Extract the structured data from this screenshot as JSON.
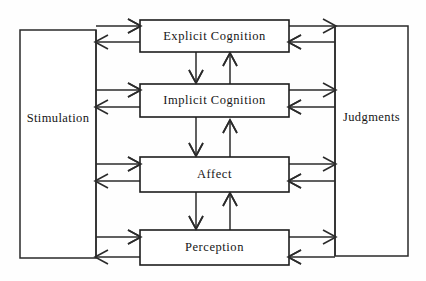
{
  "diagram": {
    "canvas": {
      "width": 426,
      "height": 281,
      "background": "#fefefe"
    },
    "colors": {
      "stroke": "#2b2b2b",
      "box_stroke": "#1d1d1d",
      "box_fill": "#ffffff",
      "text": "#161616"
    },
    "input_node": {
      "label": "Stimulation",
      "x": 20,
      "y": 30,
      "width": 76,
      "height": 228
    },
    "output_node": {
      "label": "Judgments",
      "x": 335,
      "y": 26,
      "width": 73,
      "height": 230
    },
    "process_nodes": [
      {
        "label": "Explicit Cognition",
        "x": 140,
        "y": 20,
        "width": 149,
        "height": 32
      },
      {
        "label": "Implicit Cognition",
        "x": 140,
        "y": 84,
        "width": 149,
        "height": 33
      },
      {
        "label": "Affect",
        "x": 140,
        "y": 157,
        "width": 149,
        "height": 35
      },
      {
        "label": "Perception",
        "x": 140,
        "y": 230,
        "width": 149,
        "height": 35
      }
    ],
    "connections": {
      "left_inbound": [
        {
          "from": "Stimulation",
          "to": "Explicit Cognition",
          "direction": "right"
        },
        {
          "from": "Stimulation",
          "to": "Implicit Cognition",
          "direction": "right"
        },
        {
          "from": "Stimulation",
          "to": "Affect",
          "direction": "right"
        },
        {
          "from": "Stimulation",
          "to": "Perception",
          "direction": "right"
        }
      ],
      "left_outbound": [
        {
          "from": "Explicit Cognition",
          "to": "Stimulation",
          "direction": "left"
        },
        {
          "from": "Implicit Cognition",
          "to": "Stimulation",
          "direction": "left"
        },
        {
          "from": "Affect",
          "to": "Stimulation",
          "direction": "left"
        },
        {
          "from": "Perception",
          "to": "Stimulation",
          "direction": "left"
        }
      ],
      "right_outbound": [
        {
          "from": "Explicit Cognition",
          "to": "Judgments",
          "direction": "right"
        },
        {
          "from": "Implicit Cognition",
          "to": "Judgments",
          "direction": "right"
        },
        {
          "from": "Affect",
          "to": "Judgments",
          "direction": "right"
        },
        {
          "from": "Perception",
          "to": "Judgments",
          "direction": "right"
        }
      ],
      "right_inbound": [
        {
          "from": "Judgments",
          "to": "Explicit Cognition",
          "direction": "left"
        },
        {
          "from": "Judgments",
          "to": "Implicit Cognition",
          "direction": "left"
        },
        {
          "from": "Judgments",
          "to": "Affect",
          "direction": "left"
        },
        {
          "from": "Judgments",
          "to": "Perception",
          "direction": "left"
        }
      ],
      "vertical_down": [
        {
          "from": "Explicit Cognition",
          "to": "Implicit Cognition"
        },
        {
          "from": "Implicit Cognition",
          "to": "Affect"
        },
        {
          "from": "Affect",
          "to": "Perception"
        }
      ],
      "vertical_up": [
        {
          "from": "Implicit Cognition",
          "to": "Explicit Cognition"
        },
        {
          "from": "Affect",
          "to": "Implicit Cognition"
        },
        {
          "from": "Perception",
          "to": "Affect"
        }
      ]
    }
  }
}
